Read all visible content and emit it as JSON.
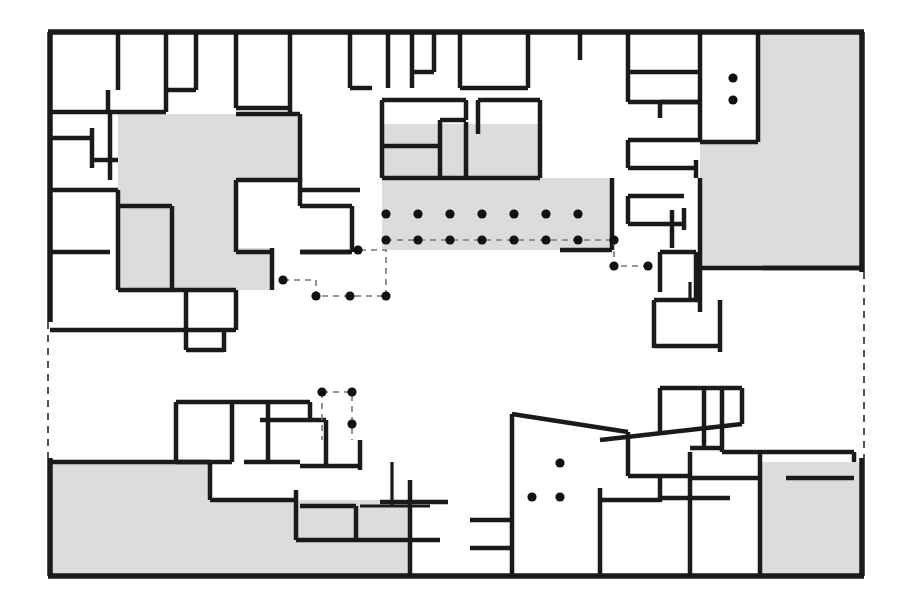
{
  "document": {
    "kind": "architectural-floor-plan",
    "title": "",
    "caption": "",
    "background_color": "#ffffff",
    "line_color": "#1a1a1a",
    "shaded_zone_color": "#dcdcdc",
    "dashed_edge_color": "#555555",
    "column_dot_color": "#111111"
  },
  "plan": {
    "bounds": {
      "x": 48,
      "y": 30,
      "width": 816,
      "height": 548
    },
    "outer_outline_points": "48,30 864,30 864,578 48,578 48,30",
    "dashed_boundary_segments": [
      {
        "name": "left-dashed-break",
        "x1": 48,
        "y1": 322,
        "x2": 48,
        "y2": 458
      },
      {
        "name": "right-dashed-break",
        "x1": 864,
        "y1": 272,
        "x2": 864,
        "y2": 458
      }
    ],
    "shaded_zones": [
      {
        "name": "zone-upper-left-courtyard",
        "points": "118,114 300,114 300,180 236,180 236,248 272,248 272,290 118,290"
      },
      {
        "name": "zone-upper-center-hall",
        "points": "382,178 612,178 612,250 382,250"
      },
      {
        "name": "zone-upper-center-inner",
        "points": "382,124 540,124 540,178 382,178"
      },
      {
        "name": "zone-upper-right-block",
        "points": "758,34 862,34 862,268 700,268 700,142 758,142"
      },
      {
        "name": "zone-lower-left-block",
        "points": "50,462 210,462 210,500 296,500 296,540 410,540 410,576 50,576"
      },
      {
        "name": "zone-lower-center-strip",
        "points": "296,500 410,500 410,540 296,540"
      },
      {
        "name": "zone-lower-right-block",
        "points": "760,462 862,462 862,576 760,576"
      }
    ],
    "column_rows": [
      {
        "name": "column-row-upper",
        "y": 214,
        "x_positions": [
          386,
          418,
          450,
          482,
          514,
          546,
          578
        ]
      },
      {
        "name": "column-row-lower",
        "y": 240,
        "x_positions": [
          386,
          418,
          450,
          482,
          514,
          546,
          578,
          614
        ]
      }
    ],
    "column_dots_single": [
      {
        "name": "dot-upper-right-a",
        "x": 733,
        "y": 78
      },
      {
        "name": "dot-upper-right-b",
        "x": 733,
        "y": 100
      },
      {
        "name": "dot-grid-left-a",
        "x": 283,
        "y": 280
      },
      {
        "name": "dot-grid-left-b",
        "x": 316,
        "y": 296
      },
      {
        "name": "dot-grid-left-c",
        "x": 350,
        "y": 296
      },
      {
        "name": "dot-grid-left-d",
        "x": 386,
        "y": 296
      },
      {
        "name": "dot-grid-left-e",
        "x": 358,
        "y": 250
      },
      {
        "name": "dot-grid-right-a",
        "x": 614,
        "y": 266
      },
      {
        "name": "dot-grid-right-b",
        "x": 648,
        "y": 266
      },
      {
        "name": "dot-lower-box-a",
        "x": 322,
        "y": 392
      },
      {
        "name": "dot-lower-box-b",
        "x": 352,
        "y": 392
      },
      {
        "name": "dot-lower-box-c",
        "x": 352,
        "y": 424
      },
      {
        "name": "dot-lower-room-a",
        "x": 560,
        "y": 463
      },
      {
        "name": "dot-lower-room-b",
        "x": 532,
        "y": 497
      },
      {
        "name": "dot-lower-room-c",
        "x": 560,
        "y": 497
      }
    ],
    "dashed_detail_paths": [
      {
        "name": "dashed-grid-left-upper",
        "d": "M 283 280 L 316 280 L 316 296 L 386 296"
      },
      {
        "name": "dashed-grid-left-lower",
        "d": "M 386 296 L 386 250 L 358 250"
      },
      {
        "name": "dashed-grid-center-axis",
        "d": "M 386 240 L 614 240"
      },
      {
        "name": "dashed-grid-right-box",
        "d": "M 614 240 L 614 266 L 648 266"
      },
      {
        "name": "dashed-lower-box",
        "d": "M 322 392 L 352 392 L 352 424 L 352 440"
      },
      {
        "name": "dashed-lower-box-left",
        "d": "M 322 392 L 322 440"
      }
    ],
    "walls": [
      {
        "name": "wall-top-outer",
        "d": "M 48 32 L 864 32",
        "weight": "heavy"
      },
      {
        "name": "wall-bottom-outer",
        "d": "M 48 576 L 864 576",
        "weight": "heavy"
      },
      {
        "name": "wall-left-outer-upper",
        "d": "M 50 32 L 50 322",
        "weight": "heavy"
      },
      {
        "name": "wall-left-outer-lower",
        "d": "M 50 458 L 50 576",
        "weight": "heavy"
      },
      {
        "name": "wall-right-outer-upper",
        "d": "M 862 32 L 862 272",
        "weight": "heavy"
      },
      {
        "name": "wall-right-outer-lower",
        "d": "M 862 458 L 862 576",
        "weight": "heavy"
      },
      {
        "name": "wall-tl-v1",
        "d": "M 118 32 L 118 90",
        "weight": "med"
      },
      {
        "name": "wall-tl-h1",
        "d": "M 50 112 L 166 112",
        "weight": "med"
      },
      {
        "name": "wall-tl-v2",
        "d": "M 108 90 L 108 112",
        "weight": "med"
      },
      {
        "name": "wall-tl-v3",
        "d": "M 110 112 L 110 180",
        "weight": "med"
      },
      {
        "name": "wall-tl-h2",
        "d": "M 50 138 L 92 138",
        "weight": "med"
      },
      {
        "name": "wall-tl-v4",
        "d": "M 92 128 L 92 168",
        "weight": "med"
      },
      {
        "name": "wall-tl-h3",
        "d": "M 92 160 L 118 160",
        "weight": "med"
      },
      {
        "name": "wall-tl-h4",
        "d": "M 50 190 L 118 190",
        "weight": "med"
      },
      {
        "name": "wall-tl-v5",
        "d": "M 118 190 L 118 290",
        "weight": "med"
      },
      {
        "name": "wall-tl-h5",
        "d": "M 50 252 L 110 252",
        "weight": "med"
      },
      {
        "name": "wall-tl-h6",
        "d": "M 118 206 L 172 206",
        "weight": "med"
      },
      {
        "name": "wall-tl-v6",
        "d": "M 172 206 L 172 290",
        "weight": "med"
      },
      {
        "name": "wall-tl-h7",
        "d": "M 118 290 L 236 290",
        "weight": "med"
      },
      {
        "name": "wall-tl-v7",
        "d": "M 236 290 L 236 330",
        "weight": "med"
      },
      {
        "name": "wall-tl-h8",
        "d": "M 50 330 L 236 330",
        "weight": "med"
      },
      {
        "name": "wall-tl-v8",
        "d": "M 186 290 L 186 350",
        "weight": "med"
      },
      {
        "name": "wall-tl-h9",
        "d": "M 186 350 L 224 350",
        "weight": "med"
      },
      {
        "name": "wall-tl-v9",
        "d": "M 224 330 L 224 352",
        "weight": "med"
      },
      {
        "name": "wall-tc-v1",
        "d": "M 166 32 L 166 112",
        "weight": "med"
      },
      {
        "name": "wall-tc-v2",
        "d": "M 196 32 L 196 90",
        "weight": "med"
      },
      {
        "name": "wall-tc-h1",
        "d": "M 166 90 L 196 90",
        "weight": "med"
      },
      {
        "name": "wall-tc-v3",
        "d": "M 236 32 L 236 108",
        "weight": "med"
      },
      {
        "name": "wall-tc-h2",
        "d": "M 236 108 L 290 108",
        "weight": "med"
      },
      {
        "name": "wall-tc-v4",
        "d": "M 290 32 L 290 114",
        "weight": "med"
      },
      {
        "name": "wall-tc-h3",
        "d": "M 236 114 L 300 114",
        "weight": "med"
      },
      {
        "name": "wall-tc-v5",
        "d": "M 300 114 L 300 180",
        "weight": "med"
      },
      {
        "name": "wall-tc-h4",
        "d": "M 236 180 L 300 180",
        "weight": "med"
      },
      {
        "name": "wall-tc-v6",
        "d": "M 236 180 L 236 252",
        "weight": "med"
      },
      {
        "name": "wall-tc-h5",
        "d": "M 236 252 L 272 252",
        "weight": "med"
      },
      {
        "name": "wall-tc-v7",
        "d": "M 272 248 L 272 290",
        "weight": "med"
      },
      {
        "name": "wall-tc-h6",
        "d": "M 300 252 L 350 252",
        "weight": "med"
      },
      {
        "name": "wall-mid-v1",
        "d": "M 350 32 L 350 88",
        "weight": "med"
      },
      {
        "name": "wall-mid-h1",
        "d": "M 350 88 L 372 88",
        "weight": "med"
      },
      {
        "name": "wall-mid-v2",
        "d": "M 388 32 L 388 88",
        "weight": "med"
      },
      {
        "name": "wall-mid-v3",
        "d": "M 412 32 L 412 88",
        "weight": "med"
      },
      {
        "name": "wall-mid-h2",
        "d": "M 412 72 L 434 72",
        "weight": "med"
      },
      {
        "name": "wall-mid-v4",
        "d": "M 434 32 L 434 72",
        "weight": "med"
      },
      {
        "name": "wall-uc-h1",
        "d": "M 382 100 L 466 100",
        "weight": "med"
      },
      {
        "name": "wall-uc-v1",
        "d": "M 382 100 L 382 178",
        "weight": "med"
      },
      {
        "name": "wall-uc-h2",
        "d": "M 382 146 L 440 146",
        "weight": "med"
      },
      {
        "name": "wall-uc-v2",
        "d": "M 440 146 L 440 178",
        "weight": "med"
      },
      {
        "name": "wall-uc-v3",
        "d": "M 466 100 L 466 120",
        "weight": "med"
      },
      {
        "name": "wall-uc-h3",
        "d": "M 440 120 L 466 120",
        "weight": "med"
      },
      {
        "name": "wall-uc-v4",
        "d": "M 440 120 L 440 146",
        "weight": "med"
      },
      {
        "name": "wall-uc-v5",
        "d": "M 478 100 L 478 134",
        "weight": "med"
      },
      {
        "name": "wall-uc-h4",
        "d": "M 478 100 L 540 100",
        "weight": "med"
      },
      {
        "name": "wall-uc-v6",
        "d": "M 540 100 L 540 178",
        "weight": "med"
      },
      {
        "name": "wall-uc-h5",
        "d": "M 440 178 L 540 178",
        "weight": "med"
      },
      {
        "name": "wall-uc-v7",
        "d": "M 466 122 L 466 178",
        "weight": "med"
      },
      {
        "name": "wall-uc-h6",
        "d": "M 382 178 L 440 178",
        "weight": "med"
      },
      {
        "name": "wall-tm-v1",
        "d": "M 460 32 L 460 88",
        "weight": "med"
      },
      {
        "name": "wall-tm-h1",
        "d": "M 460 88 L 528 88",
        "weight": "med"
      },
      {
        "name": "wall-tm-v2",
        "d": "M 528 32 L 528 88",
        "weight": "med"
      },
      {
        "name": "wall-tm-v3",
        "d": "M 580 32 L 580 60",
        "weight": "med"
      },
      {
        "name": "wall-tr-v1",
        "d": "M 628 32 L 628 72",
        "weight": "med"
      },
      {
        "name": "wall-tr-h1",
        "d": "M 628 72 L 700 72",
        "weight": "med"
      },
      {
        "name": "wall-tr-v2",
        "d": "M 700 32 L 700 142",
        "weight": "med"
      },
      {
        "name": "wall-tr-h2",
        "d": "M 628 102 L 700 102",
        "weight": "med"
      },
      {
        "name": "wall-tr-v3",
        "d": "M 628 72 L 628 102",
        "weight": "med"
      },
      {
        "name": "wall-tr-h3",
        "d": "M 660 102 L 700 102",
        "weight": "med"
      },
      {
        "name": "wall-tr-v4",
        "d": "M 660 102 L 660 118",
        "weight": "med"
      },
      {
        "name": "wall-tr-h4",
        "d": "M 628 140 L 700 140",
        "weight": "med"
      },
      {
        "name": "wall-tr-h5",
        "d": "M 628 168 L 696 168",
        "weight": "med"
      },
      {
        "name": "wall-tr-v5",
        "d": "M 628 140 L 628 168",
        "weight": "med"
      },
      {
        "name": "wall-tr-v6",
        "d": "M 696 160 L 696 178",
        "weight": "med"
      },
      {
        "name": "wall-tr-h6",
        "d": "M 700 142 L 758 142",
        "weight": "med"
      },
      {
        "name": "wall-tr-v7",
        "d": "M 758 34 L 758 142",
        "weight": "med"
      },
      {
        "name": "wall-tr-h7",
        "d": "M 700 268 L 862 268",
        "weight": "med"
      },
      {
        "name": "wall-tr-v8",
        "d": "M 700 178 L 700 268",
        "weight": "med"
      },
      {
        "name": "wall-tr-h8",
        "d": "M 628 196 L 684 196",
        "weight": "med"
      },
      {
        "name": "wall-tr-v9",
        "d": "M 628 196 L 628 224",
        "weight": "med"
      },
      {
        "name": "wall-tr-h9",
        "d": "M 628 224 L 684 224",
        "weight": "med"
      },
      {
        "name": "wall-tr-v10",
        "d": "M 684 208 L 684 230",
        "weight": "med"
      },
      {
        "name": "wall-tr-h10",
        "d": "M 762 268 L 862 268",
        "weight": "med"
      },
      {
        "name": "wall-rt-v1",
        "d": "M 612 178 L 612 250",
        "weight": "med"
      },
      {
        "name": "wall-rt-h1",
        "d": "M 560 250 L 612 250",
        "weight": "med"
      },
      {
        "name": "wall-rt-v2",
        "d": "M 672 210 L 672 248",
        "weight": "med"
      },
      {
        "name": "wall-mr-v1",
        "d": "M 660 252 L 660 292",
        "weight": "med"
      },
      {
        "name": "wall-mr-h1",
        "d": "M 660 252 L 696 252",
        "weight": "med"
      },
      {
        "name": "wall-mr-v2",
        "d": "M 696 252 L 696 300",
        "weight": "med"
      },
      {
        "name": "wall-mr-h2",
        "d": "M 654 300 L 700 300",
        "weight": "med"
      },
      {
        "name": "wall-mr-v3",
        "d": "M 700 268 L 700 312",
        "weight": "med"
      },
      {
        "name": "wall-mr-h3",
        "d": "M 654 346 L 720 346",
        "weight": "med"
      },
      {
        "name": "wall-mr-v4",
        "d": "M 720 300 L 720 352",
        "weight": "med"
      },
      {
        "name": "wall-mr-v5",
        "d": "M 654 300 L 654 348",
        "weight": "med"
      },
      {
        "name": "wall-mr-h4",
        "d": "M 690 282 L 690 300",
        "weight": "light"
      },
      {
        "name": "wall-ml-h1",
        "d": "M 300 190 L 360 190",
        "weight": "med"
      },
      {
        "name": "wall-ml-v1",
        "d": "M 300 178 L 300 206",
        "weight": "med"
      },
      {
        "name": "wall-ml-h2",
        "d": "M 300 206 L 352 206",
        "weight": "med"
      },
      {
        "name": "wall-ml-v2",
        "d": "M 352 206 L 352 252",
        "weight": "med"
      },
      {
        "name": "wall-ml-h3",
        "d": "M 300 252 L 352 252",
        "weight": "med"
      },
      {
        "name": "wall-bl-v1",
        "d": "M 176 402 L 176 462",
        "weight": "med"
      },
      {
        "name": "wall-bl-h1",
        "d": "M 176 402 L 310 402",
        "weight": "med"
      },
      {
        "name": "wall-bl-v2",
        "d": "M 232 402 L 232 462",
        "weight": "med"
      },
      {
        "name": "wall-bl-h2",
        "d": "M 176 462 L 232 462",
        "weight": "med"
      },
      {
        "name": "wall-bl-v3",
        "d": "M 268 402 L 268 462",
        "weight": "med"
      },
      {
        "name": "wall-bl-h3",
        "d": "M 244 462 L 300 462",
        "weight": "med"
      },
      {
        "name": "wall-bl-v4",
        "d": "M 310 402 L 310 420",
        "weight": "med"
      },
      {
        "name": "wall-bl-h4",
        "d": "M 260 420 L 326 420",
        "weight": "med"
      },
      {
        "name": "wall-bl-v5",
        "d": "M 326 420 L 326 466",
        "weight": "med"
      },
      {
        "name": "wall-bl-h5",
        "d": "M 300 466 L 360 466",
        "weight": "med"
      },
      {
        "name": "wall-bl-v6",
        "d": "M 360 440 L 360 470",
        "weight": "med"
      },
      {
        "name": "wall-bl-h6",
        "d": "M 50 462 L 210 462",
        "weight": "med"
      },
      {
        "name": "wall-bl-v7",
        "d": "M 210 462 L 210 500",
        "weight": "med"
      },
      {
        "name": "wall-bl-h7",
        "d": "M 210 500 L 296 500",
        "weight": "med"
      },
      {
        "name": "wall-bl-v8",
        "d": "M 296 490 L 296 540",
        "weight": "med"
      },
      {
        "name": "wall-bl-h8",
        "d": "M 296 540 L 356 540",
        "weight": "med"
      },
      {
        "name": "wall-bl-v9",
        "d": "M 356 506 L 356 542",
        "weight": "med"
      },
      {
        "name": "wall-bl-h9",
        "d": "M 300 506 L 356 506",
        "weight": "med"
      },
      {
        "name": "wall-bc-v1",
        "d": "M 410 480 L 410 576",
        "weight": "med"
      },
      {
        "name": "wall-bc-h1",
        "d": "M 380 502 L 448 502",
        "weight": "med"
      },
      {
        "name": "wall-bc-h2",
        "d": "M 356 540 L 440 540",
        "weight": "med"
      },
      {
        "name": "wall-bc-v2",
        "d": "M 392 462 L 392 506",
        "weight": "light"
      },
      {
        "name": "wall-bc-h3",
        "d": "M 360 506 L 430 506",
        "weight": "light"
      },
      {
        "name": "wall-bm-v1",
        "d": "M 512 414 L 512 576",
        "weight": "med"
      },
      {
        "name": "wall-bm-h1",
        "d": "M 512 414 L 628 432",
        "weight": "med"
      },
      {
        "name": "wall-bm-v2",
        "d": "M 628 432 L 628 476",
        "weight": "med"
      },
      {
        "name": "wall-bm-h2",
        "d": "M 470 520 L 512 520",
        "weight": "med"
      },
      {
        "name": "wall-bm-h3",
        "d": "M 470 548 L 512 548",
        "weight": "med"
      },
      {
        "name": "wall-br-h1",
        "d": "M 600 440 L 742 424",
        "weight": "med"
      },
      {
        "name": "wall-br-v1",
        "d": "M 742 388 L 742 424",
        "weight": "med"
      },
      {
        "name": "wall-br-h2",
        "d": "M 660 388 L 742 388",
        "weight": "med"
      },
      {
        "name": "wall-br-v2",
        "d": "M 660 388 L 660 432",
        "weight": "med"
      },
      {
        "name": "wall-br-v3",
        "d": "M 704 390 L 704 448",
        "weight": "med"
      },
      {
        "name": "wall-br-h3",
        "d": "M 690 448 L 722 448",
        "weight": "med"
      },
      {
        "name": "wall-br-v4",
        "d": "M 722 390 L 722 452",
        "weight": "med"
      },
      {
        "name": "wall-br-h4",
        "d": "M 722 452 L 854 452",
        "weight": "med"
      },
      {
        "name": "wall-br-h5",
        "d": "M 690 478 L 760 478",
        "weight": "med"
      },
      {
        "name": "wall-br-v5",
        "d": "M 760 452 L 760 576",
        "weight": "med"
      },
      {
        "name": "wall-br-h6",
        "d": "M 660 498 L 730 498",
        "weight": "med"
      },
      {
        "name": "wall-br-v6",
        "d": "M 660 478 L 660 502",
        "weight": "med"
      },
      {
        "name": "wall-br-h7",
        "d": "M 600 500 L 660 500",
        "weight": "med"
      },
      {
        "name": "wall-br-v7",
        "d": "M 600 488 L 600 576",
        "weight": "med"
      },
      {
        "name": "wall-br-v8",
        "d": "M 690 452 L 690 576",
        "weight": "med"
      },
      {
        "name": "wall-br-h8",
        "d": "M 628 476 L 690 476",
        "weight": "med"
      },
      {
        "name": "wall-br-v9",
        "d": "M 854 452 L 854 462",
        "weight": "med"
      },
      {
        "name": "wall-br-h9",
        "d": "M 786 478 L 854 478",
        "weight": "med"
      }
    ]
  }
}
